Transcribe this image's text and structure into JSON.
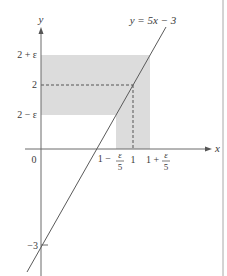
{
  "figure": {
    "equation_label": "y = 5x − 3",
    "axes": {
      "x_label": "x",
      "y_label": "y",
      "origin_label": "0"
    },
    "y_ticks": {
      "upper": "2 + ε",
      "center": "2",
      "lower": "2 − ε",
      "intercept": "−3"
    },
    "x_ticks": {
      "left_prefix": "1 −",
      "center": "1",
      "right_prefix": "1 +",
      "frac_num": "ε",
      "frac_den": "5"
    },
    "colors": {
      "shade": "#dcdcdc",
      "line": "#5a5a5a",
      "axis": "#6a6a6a",
      "border": "#9a9a9a"
    }
  }
}
